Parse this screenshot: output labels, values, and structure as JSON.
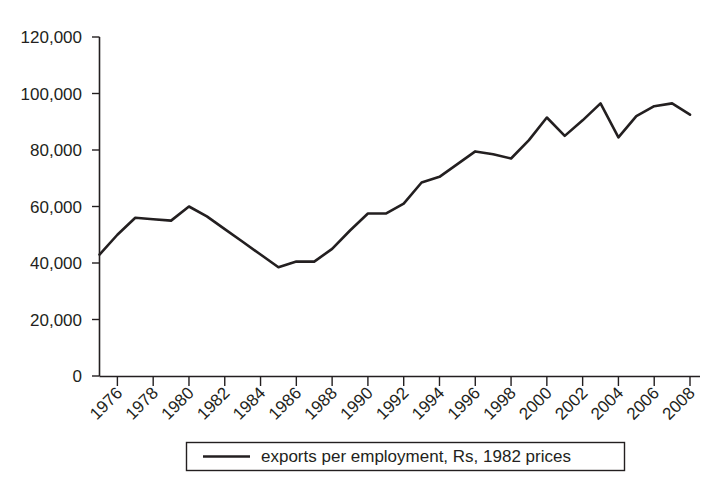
{
  "chart_data": {
    "type": "line",
    "title": "",
    "subtitle": "",
    "xlabel": "",
    "ylabel": "",
    "xlim": [
      1975,
      2008
    ],
    "ylim": [
      0,
      120000
    ],
    "grid": false,
    "legend_position": "bottom",
    "y_ticks": [
      0,
      20000,
      40000,
      60000,
      80000,
      100000,
      120000
    ],
    "y_tick_labels": [
      "0",
      "20,000",
      "40,000",
      "60,000",
      "80,000",
      "100,000",
      "120,000"
    ],
    "x_ticks": [
      1976,
      1978,
      1980,
      1982,
      1984,
      1986,
      1988,
      1990,
      1992,
      1994,
      1996,
      1998,
      2000,
      2002,
      2004,
      2006,
      2008
    ],
    "x_tick_labels": [
      "1976",
      "1978",
      "1980",
      "1982",
      "1984",
      "1986",
      "1988",
      "1990",
      "1992",
      "1994",
      "1996",
      "1998",
      "2000",
      "2002",
      "2004",
      "2006",
      "2008"
    ],
    "series": [
      {
        "name": "exports per employment, Rs, 1982 prices",
        "color": "#231f20",
        "x": [
          1975,
          1976,
          1977,
          1978,
          1979,
          1980,
          1981,
          1982,
          1983,
          1984,
          1985,
          1986,
          1987,
          1988,
          1989,
          1990,
          1991,
          1992,
          1993,
          1994,
          1995,
          1996,
          1997,
          1998,
          1999,
          2000,
          2001,
          2002,
          2003,
          2004,
          2005,
          2006,
          2007,
          2008
        ],
        "values": [
          43000,
          50000,
          56000,
          55500,
          55000,
          60000,
          56500,
          52000,
          47500,
          43000,
          38500,
          40500,
          40500,
          45000,
          51500,
          57500,
          57500,
          61000,
          68500,
          70500,
          75000,
          79500,
          78500,
          77000,
          83500,
          91500,
          85000,
          90500,
          96500,
          84500,
          92000,
          95500,
          96500,
          92500
        ]
      }
    ],
    "legend": [
      {
        "label": "exports per employment, Rs, 1982 prices"
      }
    ]
  },
  "colors": {
    "ink": "#231f20",
    "background": "#ffffff"
  }
}
